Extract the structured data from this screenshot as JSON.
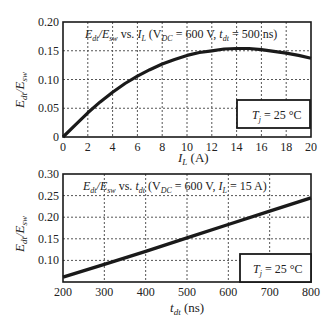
{
  "chart_data": [
    {
      "type": "line",
      "title": "E_dt/E_sw vs. I_L (V_DC = 600 V, t_dt = 500 ns)",
      "title_parts": {
        "main": "E",
        "sub1": "dt",
        "slash": "/E",
        "sub2": "sw",
        "vs": " vs. ",
        "var": "I",
        "varsub": "L",
        "open": " (V",
        "vdcsub": "DC",
        "mid": " = 600 V, ",
        "t": "t",
        "tsub": "dt",
        "end": " = 500 ns)"
      },
      "xlabel": "I_L (A)",
      "xlabel_parts": {
        "var": "I",
        "sub": "L",
        "unit": " (A)"
      },
      "ylabel": "E_dt/E_sw",
      "ylabel_parts": {
        "a": "E",
        "asub": "dt",
        "b": "/E",
        "bsub": "sw"
      },
      "xlim": [
        0,
        20
      ],
      "ylim": [
        0,
        0.2
      ],
      "xticks": [
        "0",
        "2",
        "4",
        "6",
        "8",
        "10",
        "12",
        "14",
        "16",
        "18",
        "20"
      ],
      "yticks": [
        "0",
        "0.05",
        "0.10",
        "0.15",
        "0.20"
      ],
      "grid": true,
      "annotation": {
        "t": "T",
        "sub": "j",
        "rest": " = 25 °C"
      },
      "series": [
        {
          "name": "E_dt/E_sw",
          "x": [
            0,
            1,
            2,
            3,
            4,
            5,
            6,
            7,
            8,
            9,
            10,
            11,
            12,
            13,
            14,
            15,
            16,
            17,
            18,
            19,
            20
          ],
          "values": [
            0.0,
            0.021,
            0.042,
            0.061,
            0.078,
            0.093,
            0.106,
            0.117,
            0.127,
            0.135,
            0.142,
            0.147,
            0.15,
            0.153,
            0.154,
            0.154,
            0.152,
            0.149,
            0.146,
            0.142,
            0.137
          ]
        }
      ]
    },
    {
      "type": "line",
      "title": "E_dt/E_sw vs. t_dt (V_DC = 600 V, I_L = 15 A)",
      "title_parts": {
        "main": "E",
        "sub1": "dt",
        "slash": "/E",
        "sub2": "sw",
        "vs": " vs. ",
        "var": "t",
        "varsub": "dt",
        "open": " (V",
        "vdcsub": "DC",
        "mid": " = 600 V, ",
        "t": "I",
        "tsub": "L",
        "end": " = 15 A)"
      },
      "xlabel": "t_dt (ns)",
      "xlabel_parts": {
        "var": "t",
        "sub": "dt",
        "unit": " (ns)"
      },
      "ylabel": "E_dt/E_sw",
      "ylabel_parts": {
        "a": "E",
        "asub": "dt",
        "b": "/E",
        "bsub": "sw"
      },
      "xlim": [
        200,
        800
      ],
      "ylim": [
        0.05,
        0.3
      ],
      "xticks": [
        "200",
        "300",
        "400",
        "500",
        "600",
        "700",
        "800"
      ],
      "yticks": [
        "0.10",
        "0.15",
        "0.20",
        "0.25",
        "0.30"
      ],
      "grid": true,
      "annotation": {
        "t": "T",
        "sub": "j",
        "rest": " = 25 °C"
      },
      "series": [
        {
          "name": "E_dt/E_sw",
          "x": [
            200,
            300,
            400,
            500,
            600,
            700,
            800
          ],
          "values": [
            0.061,
            0.091,
            0.121,
            0.152,
            0.183,
            0.214,
            0.245
          ]
        }
      ]
    }
  ]
}
